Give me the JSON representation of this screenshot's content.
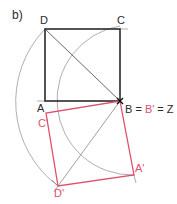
{
  "figure": {
    "part_label": "b)",
    "colors": {
      "black": "#2a2a2a",
      "red": "#e0506e",
      "arc": "#8a8a8a"
    },
    "labels": {
      "D": "D",
      "C": "C",
      "A": "A",
      "B_eq_prefix": "B = ",
      "B_prime": "B'",
      "eq_Z": " = Z",
      "C_prime": "C'",
      "A_prime": "A'",
      "D_prime": "D'"
    }
  }
}
